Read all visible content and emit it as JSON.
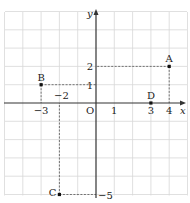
{
  "diagram": {
    "type": "coordinate-plane",
    "grid": {
      "x_min": -5,
      "x_max": 5,
      "y_min": -5,
      "y_max": 5,
      "color": "#d8d8d8"
    },
    "axes": {
      "x_label": "x",
      "y_label": "y",
      "origin_label": "O",
      "color": "#333333"
    },
    "ticks": {
      "x": [
        {
          "value": -3,
          "label": "−3"
        },
        {
          "value": -2,
          "label": "−2"
        },
        {
          "value": 1,
          "label": "1"
        },
        {
          "value": 3,
          "label": "3"
        },
        {
          "value": 4,
          "label": "4"
        }
      ],
      "y": [
        {
          "value": 2,
          "label": "2"
        },
        {
          "value": 1,
          "label": "1"
        },
        {
          "value": -5,
          "label": "−5"
        }
      ]
    },
    "points": [
      {
        "name": "A",
        "x": 4,
        "y": 2
      },
      {
        "name": "B",
        "x": -3,
        "y": 1
      },
      {
        "name": "C",
        "x": -2,
        "y": -5
      },
      {
        "name": "D",
        "x": 3,
        "y": 0
      }
    ],
    "point_color": "#111111",
    "guide_color": "#555555"
  }
}
